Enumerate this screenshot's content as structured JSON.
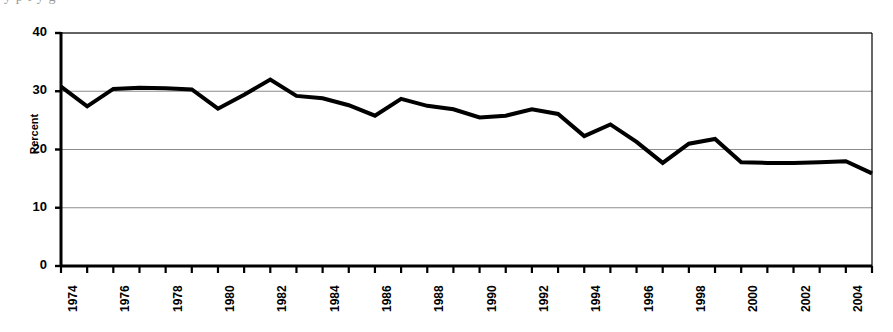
{
  "page": {
    "bleed_text": "y        p  f                                  y                                      g"
  },
  "chart_data": {
    "type": "line",
    "title": "",
    "subtitle": "",
    "xlabel": "",
    "ylabel": "Percent",
    "ylim": [
      0,
      40
    ],
    "xlim": [
      1974,
      2005
    ],
    "yticks": [
      0,
      10,
      20,
      30,
      40
    ],
    "ytick_labels": [
      "0",
      "10",
      "20",
      "30",
      "40"
    ],
    "xtick_labels": [
      "1974",
      "1976",
      "1978",
      "1980",
      "1982",
      "1984",
      "1986",
      "1988",
      "1990",
      "1992",
      "1994",
      "1996",
      "1998",
      "2000",
      "2002",
      "2004"
    ],
    "xtick_label_interval": 2,
    "xtick_minor_interval": 1,
    "grid": "horizontal",
    "grid_color": "#808080",
    "legend": "none",
    "line_color": "#000000",
    "line_width": 4,
    "x": [
      1974,
      1975,
      1976,
      1977,
      1978,
      1979,
      1980,
      1981,
      1982,
      1983,
      1984,
      1985,
      1986,
      1987,
      1988,
      1989,
      1990,
      1991,
      1992,
      1993,
      1994,
      1995,
      1996,
      1997,
      1998,
      1999,
      2000,
      2001,
      2002,
      2003,
      2004,
      2005
    ],
    "values": [
      30.8,
      27.4,
      30.4,
      30.6,
      30.5,
      30.3,
      27.0,
      29.4,
      32.0,
      29.2,
      28.8,
      27.6,
      25.8,
      28.7,
      27.5,
      26.9,
      25.5,
      25.8,
      26.9,
      26.1,
      22.3,
      24.3,
      21.3,
      17.7,
      21.0,
      21.8,
      17.8,
      17.7,
      17.7,
      17.8,
      18.0,
      15.9
    ],
    "units": "percent"
  }
}
